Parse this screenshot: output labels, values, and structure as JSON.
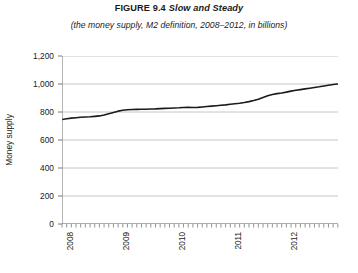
{
  "figure": {
    "number": "FIGURE 9.4",
    "name": "Slow and Steady",
    "subtitle": "(the money supply, M2 definition, 2008–2012, in billions)"
  },
  "chart_data": {
    "type": "line",
    "subtitle": "(the money supply, M2 definition, 2008–2012, in billions)",
    "xlabel": "",
    "ylabel": "Money supply",
    "ylim": [
      0,
      1200
    ],
    "yticks": [
      0,
      200,
      400,
      600,
      800,
      1000,
      1200
    ],
    "ytick_labels": [
      "0",
      "200",
      "400",
      "600",
      "800",
      "1,000",
      "1,200"
    ],
    "xlim": [
      2008,
      2012.92
    ],
    "xticks": [
      2008,
      2009,
      2010,
      2011,
      2012
    ],
    "xtick_labels": [
      "2008",
      "2009",
      "2010",
      "2011",
      "2012"
    ],
    "minor_xticks_per_year": 12,
    "grid": "horizontal",
    "legend": "none",
    "line_color": "#1a1a1a",
    "grid_color": "#b8b8b8",
    "series": [
      {
        "name": "M2 money supply",
        "units": "billions",
        "x": [
          2008.0,
          2008.083,
          2008.167,
          2008.25,
          2008.333,
          2008.417,
          2008.5,
          2008.583,
          2008.667,
          2008.75,
          2008.833,
          2008.917,
          2009.0,
          2009.083,
          2009.167,
          2009.25,
          2009.333,
          2009.417,
          2009.5,
          2009.583,
          2009.667,
          2009.75,
          2009.833,
          2009.917,
          2010.0,
          2010.083,
          2010.167,
          2010.25,
          2010.333,
          2010.417,
          2010.5,
          2010.583,
          2010.667,
          2010.75,
          2010.833,
          2010.917,
          2011.0,
          2011.083,
          2011.167,
          2011.25,
          2011.333,
          2011.417,
          2011.5,
          2011.583,
          2011.667,
          2011.75,
          2011.833,
          2011.917,
          2012.0,
          2012.083,
          2012.167,
          2012.25,
          2012.333,
          2012.417,
          2012.5,
          2012.583,
          2012.667,
          2012.75,
          2012.833,
          2012.917
        ],
        "values": [
          746,
          752,
          756,
          759,
          762,
          764,
          766,
          769,
          772,
          778,
          788,
          797,
          806,
          812,
          816,
          818,
          819,
          820,
          820,
          821,
          822,
          824,
          826,
          827,
          829,
          830,
          832,
          833,
          832,
          833,
          836,
          839,
          842,
          845,
          848,
          851,
          855,
          859,
          863,
          868,
          874,
          882,
          891,
          904,
          916,
          925,
          931,
          936,
          942,
          949,
          955,
          960,
          965,
          970,
          975,
          980,
          986,
          991,
          996,
          1000
        ]
      }
    ]
  }
}
